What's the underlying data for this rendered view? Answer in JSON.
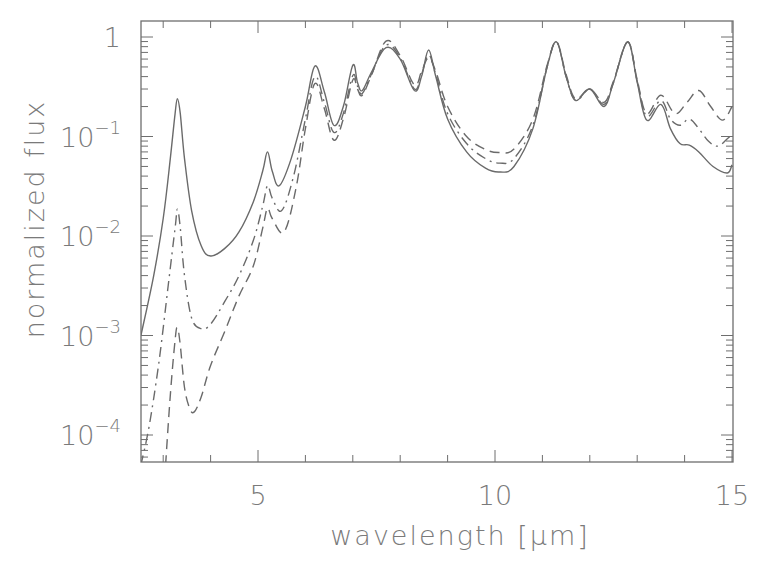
{
  "chart_data": {
    "type": "line",
    "title": "",
    "xlabel": "wavelength [μm]",
    "ylabel": "normalized flux",
    "xlim": [
      2.53,
      15.0
    ],
    "ylim": [
      5e-05,
      1.45
    ],
    "yscale": "log",
    "grid": false,
    "legend": null,
    "x_ticks": [
      {
        "value": 5,
        "label": "5"
      },
      {
        "value": 10,
        "label": "10"
      },
      {
        "value": 15,
        "label": "15"
      }
    ],
    "x_minor_ticks": [
      3,
      4,
      6,
      7,
      8,
      9,
      11,
      12,
      13,
      14
    ],
    "y_ticks": [
      {
        "value": 1,
        "label": "1",
        "exp": ""
      },
      {
        "value": 0.1,
        "label": "10",
        "exp": "−1"
      },
      {
        "value": 0.01,
        "label": "10",
        "exp": "−2"
      },
      {
        "value": 0.001,
        "label": "10",
        "exp": "−3"
      },
      {
        "value": 0.0001,
        "label": "10",
        "exp": "−4"
      }
    ],
    "series": [
      {
        "name": "solid",
        "style": "solid",
        "x": [
          2.53,
          2.8,
          3.0,
          3.15,
          3.25,
          3.3,
          3.36,
          3.45,
          3.6,
          3.8,
          4.0,
          4.3,
          4.6,
          4.9,
          5.1,
          5.2,
          5.3,
          5.45,
          5.7,
          6.0,
          6.2,
          6.4,
          6.6,
          6.8,
          7.0,
          7.1,
          7.2,
          7.4,
          7.7,
          8.0,
          8.3,
          8.45,
          8.6,
          8.75,
          9.0,
          9.4,
          9.8,
          10.1,
          10.4,
          10.8,
          11.1,
          11.3,
          11.5,
          11.7,
          12.0,
          12.3,
          12.5,
          12.8,
          13.0,
          13.2,
          13.5,
          13.7,
          13.9,
          14.1,
          14.3,
          14.6,
          14.9,
          15.0
        ],
        "values": [
          0.001,
          0.004,
          0.015,
          0.06,
          0.17,
          0.24,
          0.17,
          0.06,
          0.018,
          0.008,
          0.0063,
          0.0075,
          0.011,
          0.022,
          0.045,
          0.07,
          0.045,
          0.032,
          0.06,
          0.2,
          0.51,
          0.28,
          0.13,
          0.2,
          0.52,
          0.35,
          0.29,
          0.45,
          0.78,
          0.6,
          0.29,
          0.4,
          0.74,
          0.4,
          0.15,
          0.07,
          0.048,
          0.044,
          0.05,
          0.12,
          0.5,
          0.89,
          0.4,
          0.23,
          0.3,
          0.2,
          0.35,
          0.89,
          0.35,
          0.146,
          0.21,
          0.12,
          0.085,
          0.082,
          0.07,
          0.05,
          0.043,
          0.052
        ]
      },
      {
        "name": "dash-dot",
        "style": "dashdot",
        "x": [
          2.53,
          2.7,
          2.9,
          3.1,
          3.25,
          3.3,
          3.36,
          3.45,
          3.6,
          3.8,
          4.0,
          4.3,
          4.6,
          4.9,
          5.1,
          5.2,
          5.3,
          5.5,
          5.75,
          6.0,
          6.2,
          6.4,
          6.6,
          6.8,
          7.0,
          7.1,
          7.2,
          7.4,
          7.7,
          8.0,
          8.3,
          8.45,
          8.6,
          8.75,
          9.0,
          9.4,
          9.8,
          10.1,
          10.4,
          10.8,
          11.1,
          11.3,
          11.5,
          11.7,
          12.0,
          12.3,
          12.5,
          12.8,
          13.0,
          13.2,
          13.5,
          13.7,
          13.9,
          14.1,
          14.3,
          14.5,
          14.7,
          14.9,
          15.0
        ],
        "values": [
          5e-05,
          0.00012,
          0.0005,
          0.003,
          0.012,
          0.0186,
          0.012,
          0.004,
          0.0015,
          0.00117,
          0.0013,
          0.0022,
          0.004,
          0.009,
          0.02,
          0.032,
          0.024,
          0.018,
          0.04,
          0.15,
          0.4,
          0.22,
          0.11,
          0.17,
          0.41,
          0.32,
          0.27,
          0.43,
          0.83,
          0.62,
          0.3,
          0.42,
          0.66,
          0.42,
          0.17,
          0.085,
          0.06,
          0.054,
          0.06,
          0.13,
          0.5,
          0.89,
          0.4,
          0.23,
          0.3,
          0.21,
          0.35,
          0.89,
          0.36,
          0.16,
          0.23,
          0.15,
          0.13,
          0.15,
          0.12,
          0.09,
          0.08,
          0.095,
          0.105
        ]
      },
      {
        "name": "dashed",
        "style": "dashed",
        "x": [
          3.05,
          3.15,
          3.25,
          3.3,
          3.36,
          3.45,
          3.55,
          3.65,
          3.8,
          4.0,
          4.3,
          4.6,
          4.9,
          5.1,
          5.2,
          5.3,
          5.55,
          5.8,
          6.0,
          6.2,
          6.4,
          6.6,
          6.8,
          7.0,
          7.1,
          7.2,
          7.4,
          7.7,
          8.0,
          8.3,
          8.45,
          8.6,
          8.75,
          9.0,
          9.4,
          9.8,
          10.1,
          10.4,
          10.8,
          11.1,
          11.3,
          11.5,
          11.7,
          12.0,
          12.3,
          12.5,
          12.8,
          13.0,
          13.2,
          13.5,
          13.8,
          14.05,
          14.3,
          14.55,
          14.8,
          15.0
        ],
        "values": [
          5e-05,
          0.00025,
          0.0009,
          0.0012,
          0.0008,
          0.0003,
          0.00019,
          0.00017,
          0.00024,
          0.0005,
          0.0011,
          0.0025,
          0.005,
          0.012,
          0.019,
          0.015,
          0.011,
          0.03,
          0.12,
          0.34,
          0.19,
          0.092,
          0.15,
          0.37,
          0.3,
          0.26,
          0.42,
          0.91,
          0.65,
          0.33,
          0.45,
          0.62,
          0.45,
          0.2,
          0.1,
          0.074,
          0.069,
          0.075,
          0.15,
          0.52,
          0.89,
          0.42,
          0.24,
          0.3,
          0.22,
          0.36,
          0.89,
          0.37,
          0.17,
          0.26,
          0.17,
          0.22,
          0.29,
          0.2,
          0.146,
          0.2
        ]
      }
    ]
  }
}
